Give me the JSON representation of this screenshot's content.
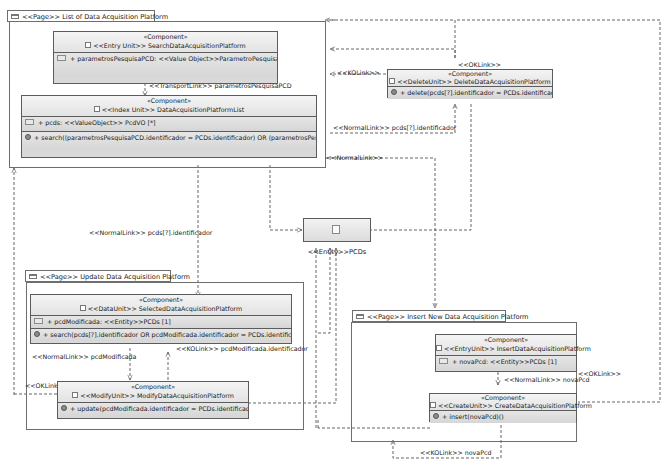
{
  "diagram": {
    "type": "WebML / IFML navigation model",
    "pages": [
      {
        "id": "list",
        "tab": "<<Page>> List of Data Acquisition Platform",
        "components": [
          {
            "stereotype": "«Component»",
            "unit": "<<Entry Unit>> SearchDataAcquisitionPlatform",
            "attributes": [
              "+ parametrosPesquisaPCD: <<Value Object>>ParametroPesquisaPCD [1]"
            ],
            "operations": []
          },
          {
            "stereotype": "«Component»",
            "unit": "<<Index Unit>> DataAcquisitionPlatformList",
            "attributes": [
              "+ pcds: <<ValueObject>> PcdVO [*]"
            ],
            "operations": [
              "+ search((parametrosPesquisaPCD.identificador = PCDs.identificador) OR (parametrosPesquisa..."
            ]
          }
        ]
      },
      {
        "id": "update",
        "tab": "<<Page>> Update Data Acquisition Platform",
        "components": [
          {
            "stereotype": "«Component»",
            "unit": "<<DataUnit>> SelectedDataAcquisitionPlatform",
            "attributes": [
              "+ pcdModificada: <<Entity>>PCDs [1]"
            ],
            "operations": [
              "+ search(pcds[?].identificador OR pcdModificada.identificador = PCDs.identificador)()"
            ]
          },
          {
            "stereotype": "«Component»",
            "unit": "<<ModifyUnit>> ModifyDataAcquisitionPlatform",
            "attributes": [],
            "operations": [
              "+ update(pcdModificada.identificador = PCDs.identificador)()"
            ]
          }
        ]
      },
      {
        "id": "insert",
        "tab": "<<Page>> Insert New Data Acquisition Platform",
        "components": [
          {
            "stereotype": "«Component»",
            "unit": "<<EntryUnit>> InsertDataAcquisitionPlatform",
            "attributes": [
              "+ novaPcd: <<Entity>>PCDs [1]"
            ],
            "operations": []
          },
          {
            "stereotype": "«Component»",
            "unit": "<<CreateUnit>> CreateDataAcquisitionPlatform",
            "attributes": [],
            "operations": [
              "+ insert(novaPcd)()"
            ]
          }
        ]
      }
    ],
    "delete_unit": {
      "stereotype": "«Component»",
      "unit": "<<DeleteUnit>> DeleteDataAcquisitionPlatform",
      "operations": [
        "+ delete(pcds[?].identificador = PCDs.identificador)()"
      ]
    },
    "entity": {
      "label": "<<Entity>>PCDs"
    },
    "link_labels": {
      "transport": "<<TransportLink>> parametrosPesquisaPCD",
      "ok_delete": "<<OKLink>>",
      "ko_delete": "<<KOLink>>",
      "normal_delete": "<<NormalLink>> pcds[?].identificador",
      "normal_insert": "<<NormalLink>>",
      "normal_update": "<<NormalLink>> pcds[?].identificador",
      "normal_modify": "<<NormalLink>> pcdModificada",
      "ko_modify": "<<KOLink>> pcdModificada.identificador",
      "ok_modify": "<<OKLink>>",
      "normal_create": "<<NormalLink>> novaPcd",
      "ok_create": "<<OKLink>>",
      "ko_create": "<<KOLink>> novaPcd"
    },
    "colors": {
      "component_fill": "#d9d9d9",
      "component_header": "#efefef",
      "border": "#5c5c5c",
      "link": "#555555",
      "background": "#ffffff"
    }
  }
}
